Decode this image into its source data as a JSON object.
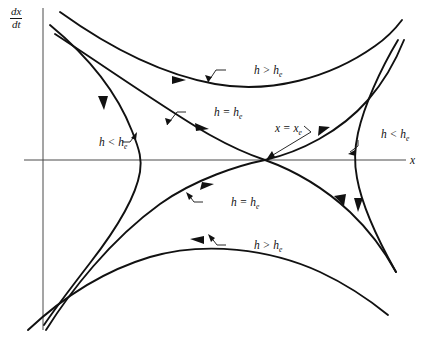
{
  "figure": {
    "type": "phase-portrait",
    "axes": {
      "x_label": "x",
      "y_label_numerator": "dx",
      "y_label_denominator": "dt",
      "x_axis_y_px": 160,
      "y_axis_x_px": 43,
      "origin_note": "axes drawn as plain lines without tick marks"
    },
    "equilibrium": {
      "label_lead": "x = x",
      "label_sub": "e",
      "x_px": 265,
      "y_px": 160,
      "kind": "saddle"
    },
    "labels": [
      {
        "id": "upper-outer",
        "lead": "h > h",
        "sub": "e",
        "x": 228,
        "y": 72,
        "curve": "upper outer orbit (h greater than critical)"
      },
      {
        "id": "upper-sep",
        "lead": "h = h",
        "sub": "e",
        "x": 188,
        "y": 115,
        "curve": "upper-left separatrix branch"
      },
      {
        "id": "equilibrium",
        "lead": "x = x",
        "sub": "e",
        "x": 249,
        "y": 131,
        "curve": "saddle equilibrium point"
      },
      {
        "id": "left-orbit",
        "lead": "h < h",
        "sub": "e",
        "x": 75,
        "y": 145,
        "curve": "left turning orbit (h less than critical)"
      },
      {
        "id": "right-orbit",
        "lead": "h < h",
        "sub": "e",
        "x": 357,
        "y": 137,
        "curve": "right turning orbit (h less than critical)"
      },
      {
        "id": "lower-sep",
        "lead": "h = h",
        "sub": "e",
        "x": 205,
        "y": 205,
        "curve": "lower-left separatrix branch"
      },
      {
        "id": "lower-outer",
        "lead": "h > h",
        "sub": "e",
        "x": 228,
        "y": 248,
        "curve": "lower outer orbit (h greater than critical)"
      }
    ],
    "curves": [
      {
        "id": "sep-upper-left-to-saddle",
        "kind": "separatrix",
        "flow": "toward saddle, rightward-descending"
      },
      {
        "id": "sep-saddle-to-lower-right",
        "kind": "separatrix",
        "flow": "away from saddle, rightward-descending"
      },
      {
        "id": "sep-lower-left-to-saddle",
        "kind": "separatrix",
        "flow": "toward saddle, rightward-ascending"
      },
      {
        "id": "orbit-upper-h-greater",
        "kind": "orbit",
        "flow": "rightward along top"
      },
      {
        "id": "orbit-lower-h-greater",
        "kind": "orbit",
        "flow": "leftward along bottom"
      },
      {
        "id": "orbit-left-h-less",
        "kind": "orbit",
        "flow": "upward on left turning point"
      },
      {
        "id": "orbit-right-h-less",
        "kind": "orbit",
        "flow": "downward on right turning point"
      }
    ],
    "ghost_text": [
      {
        "t": "in the page behind",
        "x": 214,
        "y": 18
      },
      {
        "t": "show text",
        "x": 150,
        "y": 48
      },
      {
        "t": "faint bleed-through",
        "x": 30,
        "y": 96
      },
      {
        "t": "of reverse side",
        "x": 300,
        "y": 300
      },
      {
        "t": "scanned page",
        "x": 120,
        "y": 322
      }
    ]
  }
}
